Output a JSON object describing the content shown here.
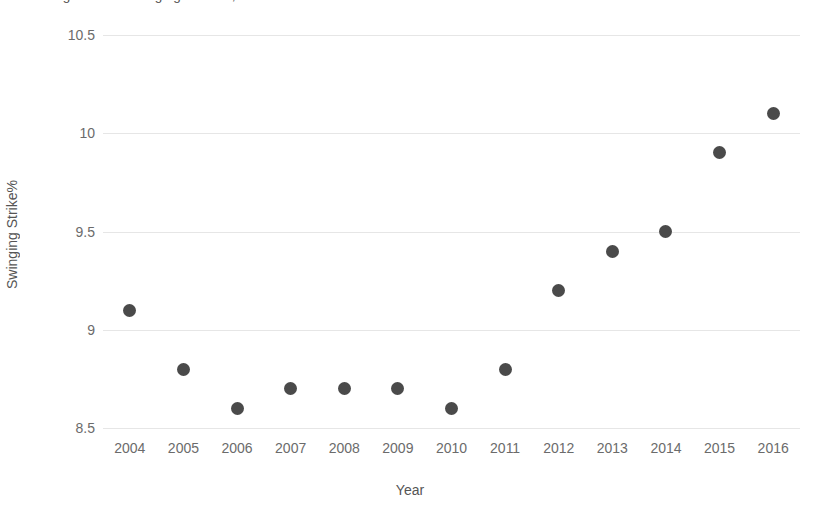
{
  "chart_data": {
    "type": "scatter",
    "title": "MLB League-Wide Swinging Strike%, 2004-2016",
    "xlabel": "Year",
    "ylabel": "Swinging Strike%",
    "x": [
      2004,
      2005,
      2006,
      2007,
      2008,
      2009,
      2010,
      2011,
      2012,
      2013,
      2014,
      2015,
      2016
    ],
    "values": [
      9.1,
      8.8,
      8.6,
      8.7,
      8.7,
      8.7,
      8.6,
      8.8,
      9.2,
      9.4,
      9.5,
      9.9,
      10.1
    ],
    "categories": [
      "2004",
      "2005",
      "2006",
      "2007",
      "2008",
      "2009",
      "2010",
      "2011",
      "2012",
      "2013",
      "2014",
      "2015",
      "2016"
    ],
    "xtick_labels": [
      "2004",
      "2005",
      "2006",
      "2007",
      "2008",
      "2009",
      "2010",
      "2011",
      "2012",
      "2013",
      "2014",
      "2015",
      "2016"
    ],
    "ytick_labels": [
      "10.5",
      "10",
      "9.5",
      "9",
      "8.5"
    ],
    "yticks": [
      10.5,
      10,
      9.5,
      9,
      8.5
    ],
    "ylim": [
      8.5,
      10.5
    ],
    "xlim": [
      2003.5,
      2016.5
    ],
    "grid": "horizontal",
    "legend": "none",
    "marker_color": "#4a4a4a",
    "gridline_color": "#e6e6e6",
    "background_color": "#ffffff",
    "axis_label_color": "#6b6b6b"
  }
}
